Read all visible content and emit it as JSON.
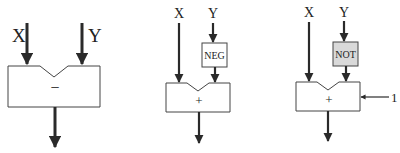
{
  "diagrams": [
    {
      "inputs": {
        "x": "X",
        "y": "Y"
      },
      "operation": "−"
    },
    {
      "inputs": {
        "x": "X",
        "y": "Y"
      },
      "preprocess": "NEG",
      "operation": "+"
    },
    {
      "inputs": {
        "x": "X",
        "y": "Y"
      },
      "preprocess": "NOT",
      "operation": "+",
      "carry_in": "1"
    }
  ],
  "colors": {
    "stroke": "#2a2a2a",
    "not_fill": "#d9d9d9",
    "neg_fill": "#ffffff"
  }
}
